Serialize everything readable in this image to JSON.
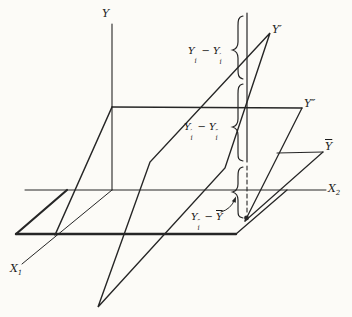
{
  "figure": {
    "background": "#fcfbf7",
    "line_color": "#262626",
    "axis_labels": {
      "y": "Y",
      "x1_base": "X",
      "x1_sub": "1",
      "x2_base": "X",
      "x2_sub": "2"
    },
    "surface_labels": {
      "y_prime": {
        "base": "Y",
        "prime": "′"
      },
      "y_double_prime": {
        "base": "Y",
        "prime": "″"
      },
      "y_bar": {
        "base": "Y"
      }
    },
    "deviation_labels": {
      "top": {
        "t1": "Y",
        "t1_prime": "",
        "t1_sub": "i",
        "op": "−",
        "t2": "Y",
        "t2_prime": "′",
        "t2_sub": "i"
      },
      "middle": {
        "t1": "Y",
        "t1_prime": "′",
        "t1_sub": "i",
        "op": "−",
        "t2": "Y",
        "t2_prime": "″",
        "t2_sub": "i"
      },
      "bottom": {
        "t1": "Y",
        "t1_prime": "″",
        "t1_sub": "i",
        "op": "−",
        "t2_bar": "Y"
      }
    }
  }
}
